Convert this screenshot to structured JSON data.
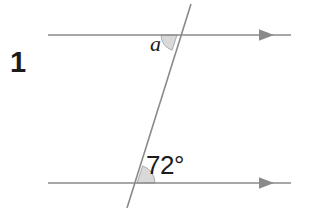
{
  "figure": {
    "problem_number": "1",
    "background_color": "#ffffff",
    "line_color": "#8a8a8a",
    "arc_fill_color": "#d9d9d9",
    "arc_stroke_color": "#9a9a9a",
    "text_color": "#1c1c1c"
  },
  "labels": {
    "problem_number": "1",
    "unknown_angle": "a",
    "known_angle": "72°"
  },
  "geometry": {
    "top_line": {
      "name": "upper-parallel-line",
      "x1": 48,
      "y1": 35,
      "x2": 291,
      "y2": 35,
      "arrow_end": "right",
      "arrow_x": 272
    },
    "bottom_line": {
      "name": "lower-parallel-line",
      "x1": 48,
      "y1": 183,
      "x2": 291,
      "y2": 183,
      "arrow_end": "right",
      "arrow_x": 272
    },
    "transversal": {
      "name": "transversal-line",
      "x1": 191,
      "y1": 4,
      "x2": 127,
      "y2": 208
    },
    "intersection_top": {
      "x": 177,
      "y": 35
    },
    "intersection_bottom": {
      "x": 137,
      "y": 183
    },
    "angle_arc_a": {
      "center_x": 177,
      "center_y": 35,
      "radius": 16,
      "start_deg": 180,
      "end_deg": 252
    },
    "angle_arc_72": {
      "center_x": 137,
      "center_y": 183,
      "radius": 18,
      "start_deg": 0,
      "end_deg": 72
    }
  }
}
